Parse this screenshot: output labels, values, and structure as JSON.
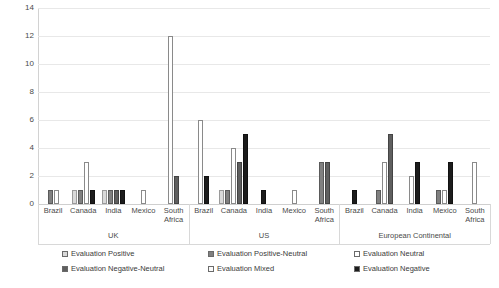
{
  "chart_data": {
    "type": "bar",
    "title": "",
    "subtitle": "",
    "xlabel": "",
    "ylabel": "",
    "ylim": [
      0,
      14
    ],
    "yticks": [
      0,
      2,
      4,
      6,
      8,
      10,
      12,
      14
    ],
    "grid": true,
    "legend_position": "bottom",
    "legend": [
      "Evaluation Positive",
      "Evaluation Positive-Neutral",
      "Evaluation Neutral",
      "Evaluation Negative-Neutral",
      "Evaluation Mixed",
      "Evaluation Negative"
    ],
    "series": [
      {
        "name": "Evaluation Positive",
        "swatch": "#d9d9d9"
      },
      {
        "name": "Evaluation Positive-Neutral",
        "swatch": "#808080"
      },
      {
        "name": "Evaluation Neutral",
        "swatch": "#ffffff"
      },
      {
        "name": "Evaluation Negative-Neutral",
        "swatch": "#5f5f5f"
      },
      {
        "name": "Evaluation Mixed",
        "swatch": "#fbfbfb"
      },
      {
        "name": "Evaluation Negative",
        "swatch": "#1c1c1c"
      }
    ],
    "outer_groups": [
      "UK",
      "US",
      "European Continental"
    ],
    "categories": [
      "Brazil",
      "Canada",
      "India",
      "Mexico",
      "South Africa"
    ],
    "groups": [
      {
        "name": "UK",
        "countries": [
          {
            "name": "Brazil",
            "values": [
              0,
              1,
              1,
              0,
              0,
              0
            ]
          },
          {
            "name": "Canada",
            "values": [
              1,
              1,
              3,
              0,
              0,
              1
            ]
          },
          {
            "name": "India",
            "values": [
              1,
              1,
              0,
              1,
              0,
              1
            ]
          },
          {
            "name": "Mexico",
            "values": [
              0,
              0,
              1,
              0,
              0,
              0
            ]
          },
          {
            "name": "South Africa",
            "values": [
              0,
              0,
              12,
              2,
              0,
              0
            ]
          }
        ]
      },
      {
        "name": "US",
        "countries": [
          {
            "name": "Brazil",
            "values": [
              0,
              0,
              6,
              0,
              0,
              2
            ]
          },
          {
            "name": "Canada",
            "values": [
              1,
              1,
              4,
              3,
              0,
              5
            ]
          },
          {
            "name": "India",
            "values": [
              0,
              0,
              0,
              0,
              0,
              1
            ]
          },
          {
            "name": "Mexico",
            "values": [
              0,
              0,
              1,
              0,
              0,
              0
            ]
          },
          {
            "name": "South Africa",
            "values": [
              0,
              3,
              0,
              3,
              0,
              0
            ]
          }
        ]
      },
      {
        "name": "European Continental",
        "countries": [
          {
            "name": "Brazil",
            "values": [
              0,
              0,
              0,
              0,
              0,
              1
            ]
          },
          {
            "name": "Canada",
            "values": [
              0,
              1,
              3,
              5,
              0,
              0
            ]
          },
          {
            "name": "India",
            "values": [
              0,
              0,
              2,
              0,
              0,
              3
            ]
          },
          {
            "name": "Mexico",
            "values": [
              0,
              1,
              1,
              0,
              0,
              3
            ]
          },
          {
            "name": "South Africa",
            "values": [
              0,
              0,
              3,
              0,
              0,
              0
            ]
          }
        ]
      }
    ]
  }
}
